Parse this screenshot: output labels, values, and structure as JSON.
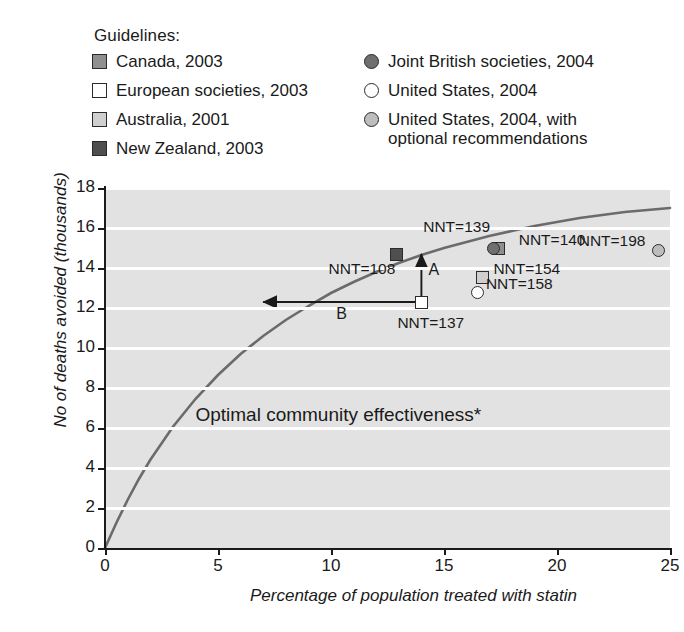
{
  "legend": {
    "title": "Guidelines:",
    "left_items": [
      {
        "label": "Canada, 2003",
        "marker": "square",
        "color": "#8f8f8f",
        "name": "legend-marker-canada"
      },
      {
        "label": "European societies, 2003",
        "marker": "square",
        "color": "#ffffff",
        "name": "legend-marker-european-societies"
      },
      {
        "label": "Australia, 2001",
        "marker": "square",
        "color": "#cfcfcf",
        "name": "legend-marker-australia"
      },
      {
        "label": "New Zealand, 2003",
        "marker": "square",
        "color": "#4f4f4f",
        "name": "legend-marker-new-zealand"
      }
    ],
    "right_items": [
      {
        "label": "Joint British societies, 2004",
        "marker": "circle",
        "color": "#6f6f6f",
        "name": "legend-marker-joint-british-societies"
      },
      {
        "label": "United States, 2004",
        "marker": "circle",
        "color": "#ffffff",
        "name": "legend-marker-united-states"
      },
      {
        "label": "United States, 2004, with\noptional recommendations",
        "marker": "circle",
        "color": "#bdbdbd",
        "name": "legend-marker-united-states-optional"
      }
    ]
  },
  "chart_data": {
    "type": "line",
    "title": "",
    "xlabel": "Percentage of population treated with statin",
    "ylabel": "No of deaths avoided (thousands)",
    "xlim": [
      0,
      25
    ],
    "ylim": [
      0,
      18
    ],
    "xticks": [
      0,
      5,
      10,
      15,
      20,
      25
    ],
    "yticks": [
      0,
      2,
      4,
      6,
      8,
      10,
      12,
      14,
      16,
      18
    ],
    "grid": "horizontal-white-bands",
    "legend_position": "above-plot",
    "curve": {
      "name": "Deaths avoided vs percentage treated",
      "color": "#6b6b6b",
      "x": [
        0,
        0.5,
        1,
        1.5,
        2,
        3,
        4,
        5,
        6,
        7,
        8,
        9,
        10,
        11,
        12,
        13,
        14,
        15,
        16,
        17,
        18,
        19,
        20,
        21,
        22,
        23,
        24,
        25
      ],
      "y": [
        0,
        1.25,
        2.4,
        3.45,
        4.4,
        6.05,
        7.45,
        8.65,
        9.7,
        10.6,
        11.4,
        12.1,
        12.75,
        13.3,
        13.8,
        14.25,
        14.65,
        15.0,
        15.3,
        15.6,
        15.85,
        16.1,
        16.3,
        16.5,
        16.65,
        16.8,
        16.9,
        17.0
      ]
    },
    "points": [
      {
        "name": "new-zealand",
        "series": "New Zealand, 2003",
        "marker": "square",
        "color": "#4f4f4f",
        "x": 12.9,
        "y": 14.7,
        "label": "NNT=108",
        "label_pos": "below-left"
      },
      {
        "name": "european-societies",
        "series": "European societies, 2003",
        "marker": "square",
        "color": "#ffffff",
        "x": 14.0,
        "y": 12.3,
        "label": "NNT=137",
        "label_pos": "below"
      },
      {
        "name": "canada",
        "series": "Canada, 2003",
        "marker": "square",
        "color": "#8f8f8f",
        "x": 17.4,
        "y": 15.0,
        "label": "NNT=139",
        "label_pos": "left"
      },
      {
        "name": "joint-british-societies",
        "series": "Joint British societies, 2004",
        "marker": "circle",
        "color": "#6f6f6f",
        "x": 17.2,
        "y": 15.0,
        "label": "NNT=140",
        "label_pos": "right"
      },
      {
        "name": "australia",
        "series": "Australia, 2001",
        "marker": "square",
        "color": "#cfcfcf",
        "x": 16.7,
        "y": 13.55,
        "label": "NNT=154",
        "label_pos": "right"
      },
      {
        "name": "united-states",
        "series": "United States, 2004",
        "marker": "circle",
        "color": "#ffffff",
        "x": 16.5,
        "y": 12.8,
        "label": "NNT=158",
        "label_pos": "right"
      },
      {
        "name": "united-states-optional",
        "series": "United States, 2004, with optional recommendations",
        "marker": "circle",
        "color": "#bdbdbd",
        "x": 24.5,
        "y": 14.9,
        "label": "NNT=198",
        "label_pos": "left"
      }
    ],
    "annotations": [
      {
        "name": "arrow-a",
        "label": "A",
        "type": "vertical-arrow",
        "from_x": 14.0,
        "from_y": 12.3,
        "to_x": 14.0,
        "to_y": 14.7
      },
      {
        "name": "arrow-b",
        "label": "B",
        "type": "horizontal-arrow",
        "from_x": 14.0,
        "from_y": 12.3,
        "to_x": 7.0,
        "to_y": 12.3
      },
      {
        "name": "optimal-community-effectiveness",
        "label": "Optimal community effectiveness*",
        "x": 4.0,
        "y": 6.6
      }
    ]
  }
}
